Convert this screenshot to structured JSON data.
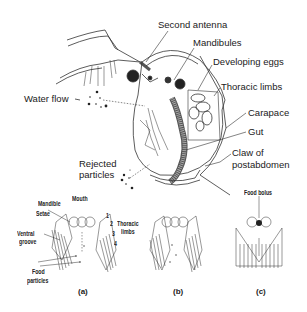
{
  "diagram": {
    "main_labels": {
      "second_antenna": "Second antenna",
      "mandibules": "Mandibules",
      "developing_eggs": "Developing eggs",
      "thoracic_limbs": "Thoracic limbs",
      "water_flow": "Water flow",
      "carapace": "Carapace",
      "gut": "Gut",
      "claw_line1": "Claw of",
      "claw_line2": "postabdomen",
      "rejected_line1": "Rejected",
      "rejected_line2": "particles"
    },
    "limb_numbers": [
      "1",
      "2",
      "3",
      "4",
      "5"
    ],
    "panel_a": {
      "caption": "(a)",
      "mouth": "Mouth",
      "mandible": "Mandible",
      "setae": "Setae",
      "ventral_line1": "Ventral",
      "ventral_line2": "groove",
      "food_line1": "Food",
      "food_line2": "particles",
      "thoracic_line1": "Thoracic",
      "thoracic_line2": "limbs",
      "limb_numbers": [
        "1",
        "2",
        "3",
        "4"
      ]
    },
    "panel_b": {
      "caption": "(b)"
    },
    "panel_c": {
      "caption": "(c)",
      "food_bolus": "Food bolus"
    }
  }
}
